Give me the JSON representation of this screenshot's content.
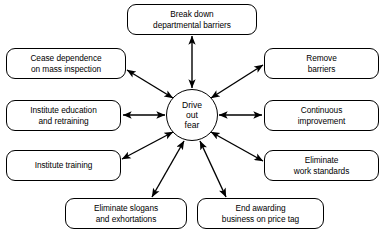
{
  "diagram": {
    "style": {
      "background": "#ffffff",
      "stroke": "#000000",
      "text": "#000000"
    },
    "center": {
      "label": "Drive\nout\nfear",
      "shape": "circle",
      "cx": 192,
      "cy": 115,
      "r": 26
    },
    "connector": {
      "type": "double-headed-arrow",
      "count": 8
    },
    "nodes": [
      {
        "id": "break-down-departmental-barriers",
        "label": "Break down\ndepartmental barriers",
        "x": 127,
        "y": 4,
        "w": 130,
        "h": 31
      },
      {
        "id": "remove-barriers",
        "label": "Remove\nbarriers",
        "x": 264,
        "y": 48,
        "w": 115,
        "h": 31
      },
      {
        "id": "continuous-improvement",
        "label": "Continuous\nimprovement",
        "x": 264,
        "y": 100,
        "w": 115,
        "h": 31
      },
      {
        "id": "eliminate-work-standards",
        "label": "Eliminate\nwork standards",
        "x": 264,
        "y": 150,
        "w": 115,
        "h": 31
      },
      {
        "id": "end-awarding-business-on-price-tag",
        "label": "End awarding\nbusiness on price tag",
        "x": 197,
        "y": 198,
        "w": 127,
        "h": 31
      },
      {
        "id": "eliminate-slogans-and-exhortations",
        "label": "Eliminate slogans\nand exhortations",
        "x": 65,
        "y": 198,
        "w": 122,
        "h": 31
      },
      {
        "id": "institute-training",
        "label": "Institute training",
        "x": 6,
        "y": 150,
        "w": 115,
        "h": 31
      },
      {
        "id": "institute-education-and-retraining",
        "label": "Institute education\nand retraining",
        "x": 6,
        "y": 100,
        "w": 115,
        "h": 31
      },
      {
        "id": "cease-dependence-on-mass-inspection",
        "label": "Cease dependence\non mass inspection",
        "x": 6,
        "y": 48,
        "w": 120,
        "h": 31
      }
    ],
    "edges": [
      {
        "id": "edge-break-down-departmental-barriers",
        "x1": 192,
        "y1": 36,
        "x2": 192,
        "y2": 88
      },
      {
        "id": "edge-remove-barriers",
        "x1": 263,
        "y1": 65,
        "x2": 211,
        "y2": 98
      },
      {
        "id": "edge-continuous-improvement",
        "x1": 262,
        "y1": 115,
        "x2": 219,
        "y2": 115
      },
      {
        "id": "edge-eliminate-work-standards",
        "x1": 263,
        "y1": 161,
        "x2": 211,
        "y2": 132
      },
      {
        "id": "edge-end-awarding-business-on-price-tag",
        "x1": 226,
        "y1": 197,
        "x2": 200,
        "y2": 141
      },
      {
        "id": "edge-eliminate-slogans-and-exhortations",
        "x1": 152,
        "y1": 197,
        "x2": 184,
        "y2": 141
      },
      {
        "id": "edge-institute-training",
        "x1": 122,
        "y1": 159,
        "x2": 173,
        "y2": 132
      },
      {
        "id": "edge-institute-education-and-retraining",
        "x1": 123,
        "y1": 115,
        "x2": 165,
        "y2": 115
      },
      {
        "id": "edge-cease-dependence-on-mass-inspection",
        "x1": 127,
        "y1": 70,
        "x2": 173,
        "y2": 98
      }
    ]
  }
}
